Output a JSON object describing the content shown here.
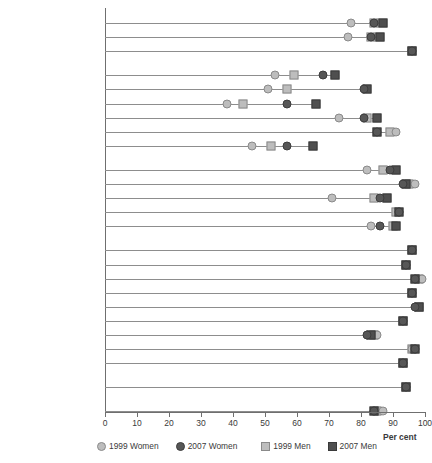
{
  "chart_data": {
    "type": "scatter",
    "title": "",
    "xlabel": "Per cent",
    "ylabel": "",
    "xlim": [
      0,
      100
    ],
    "xticks": [
      0,
      10,
      20,
      30,
      40,
      50,
      60,
      70,
      80,
      90,
      100
    ],
    "grid": false,
    "legend_position": "bottom",
    "series": [
      {
        "name": "1999 Women",
        "marker": "circle",
        "color": "#bdbdbd"
      },
      {
        "name": "2007 Women",
        "marker": "circle",
        "color": "#575757"
      },
      {
        "name": "1999 Men",
        "marker": "square",
        "color": "#bdbdbd"
      },
      {
        "name": "2007 Men",
        "marker": "square",
        "color": "#4f4f4f"
      }
    ],
    "categories": [
      {
        "label": "World",
        "bold": true,
        "spacer_before": false,
        "values": {
          "1999 Women": 77,
          "2007 Women": 84,
          "1999 Men": 84,
          "2007 Men": 87
        }
      },
      {
        "label": "Less developed regions",
        "bold": false,
        "spacer_before": false,
        "values": {
          "1999 Women": 76,
          "2007 Women": 83,
          "1999 Men": 83,
          "2007 Men": 86
        }
      },
      {
        "label": "More developed regions",
        "bold": false,
        "spacer_before": false,
        "values": {
          "1999 Women": 96,
          "2007 Women": 96,
          "1999 Men": 96,
          "2007 Men": 96
        }
      },
      {
        "label": "Africa",
        "bold": true,
        "spacer_before": true,
        "values": {
          "1999 Women": 53,
          "2007 Women": 68,
          "1999 Men": 59,
          "2007 Men": 72
        }
      },
      {
        "label": "Eastern Africa",
        "bold": false,
        "spacer_before": false,
        "values": {
          "1999 Women": 51,
          "2007 Women": 81,
          "1999 Men": 57,
          "2007 Men": 82
        }
      },
      {
        "label": "Middle Africa",
        "bold": false,
        "spacer_before": false,
        "values": {
          "1999 Women": 38,
          "2007 Women": 57,
          "1999 Men": 43,
          "2007 Men": 66
        }
      },
      {
        "label": "Northern Africa",
        "bold": false,
        "spacer_before": false,
        "values": {
          "1999 Women": 73,
          "2007 Women": 81,
          "1999 Men": 82,
          "2007 Men": 85
        }
      },
      {
        "label": "Southern Africa",
        "bold": false,
        "spacer_before": false,
        "values": {
          "1999 Women": 91,
          "2007 Women": 85,
          "1999 Men": 89,
          "2007 Men": 85
        }
      },
      {
        "label": "Western Africa",
        "bold": false,
        "spacer_before": false,
        "values": {
          "1999 Women": 46,
          "2007 Women": 57,
          "1999 Men": 52,
          "2007 Men": 65
        }
      },
      {
        "label": "Asia",
        "bold": true,
        "spacer_before": true,
        "values": {
          "1999 Women": 82,
          "2007 Women": 89,
          "1999 Men": 87,
          "2007 Men": 91
        }
      },
      {
        "label": "Eastern Asia",
        "bold": false,
        "spacer_before": false,
        "values": {
          "1999 Women": 97,
          "2007 Women": 93,
          "1999 Men": 95,
          "2007 Men": 94
        }
      },
      {
        "label": "South-Central Asia",
        "bold": false,
        "spacer_before": false,
        "values": {
          "1999 Women": 71,
          "2007 Women": 86,
          "1999 Men": 84,
          "2007 Men": 88
        }
      },
      {
        "label": "South-Eastern Asia",
        "bold": false,
        "spacer_before": false,
        "values": {
          "1999 Women": 92,
          "2007 Women": 92,
          "1999 Men": 91,
          "2007 Men": 92
        }
      },
      {
        "label": "Western Asia",
        "bold": false,
        "spacer_before": false,
        "values": {
          "1999 Women": 83,
          "2007 Women": 86,
          "1999 Men": 90,
          "2007 Men": 91
        }
      },
      {
        "label": "Europe",
        "bold": true,
        "spacer_before": true,
        "values": {
          "1999 Women": 96,
          "2007 Women": 96,
          "1999 Men": 96,
          "2007 Men": 96
        }
      },
      {
        "label": "Eastern Europe",
        "bold": false,
        "spacer_before": false,
        "values": {
          "1999 Women": 94,
          "2007 Women": 94,
          "1999 Men": 94,
          "2007 Men": 94
        }
      },
      {
        "label": "Northern Europe",
        "bold": false,
        "spacer_before": false,
        "values": {
          "1999 Women": 99,
          "2007 Women": 97,
          "1999 Men": 98,
          "2007 Men": 97
        }
      },
      {
        "label": "Southern Europe",
        "bold": false,
        "spacer_before": false,
        "values": {
          "1999 Women": 96,
          "2007 Women": 96,
          "1999 Men": 96,
          "2007 Men": 96
        }
      },
      {
        "label": "Western Europe",
        "bold": false,
        "spacer_before": false,
        "values": {
          "1999 Women": 98,
          "2007 Women": 97,
          "1999 Men": 98,
          "2007 Men": 98
        }
      },
      {
        "label": "Latin America and the Caribbean",
        "bold": true,
        "spacer_before": false,
        "two_line": true,
        "values": {
          "1999 Women": 93,
          "2007 Women": 93,
          "1999 Men": 93,
          "2007 Men": 93
        }
      },
      {
        "label": "Caribbean",
        "bold": false,
        "spacer_before": false,
        "values": {
          "1999 Women": 85,
          "2007 Women": 82,
          "1999 Men": 84,
          "2007 Men": 83
        }
      },
      {
        "label": "Central America",
        "bold": false,
        "spacer_before": false,
        "values": {
          "1999 Women": 96,
          "2007 Women": 97,
          "1999 Men": 96,
          "2007 Men": 97
        }
      },
      {
        "label": "South America",
        "bold": false,
        "spacer_before": false,
        "values": {
          "1999 Women": 93,
          "2007 Women": 93,
          "1999 Men": 93,
          "2007 Men": 93
        }
      },
      {
        "label": "Northern America",
        "bold": true,
        "spacer_before": true,
        "values": {
          "1999 Women": 94,
          "2007 Women": 94,
          "1999 Men": 94,
          "2007 Men": 94
        }
      },
      {
        "label": "Oceania",
        "bold": true,
        "spacer_before": true,
        "values": {
          "1999 Women": 87,
          "2007 Women": 84,
          "1999 Men": 85,
          "2007 Men": 84
        }
      }
    ]
  },
  "axis": {
    "tick_labels": [
      "0",
      "10",
      "20",
      "30",
      "40",
      "50",
      "60",
      "70",
      "80",
      "90",
      "100"
    ],
    "title": "Per cent"
  },
  "legend": {
    "items": [
      {
        "label": "1999 Women",
        "shape": "circle",
        "tone": "light"
      },
      {
        "label": "2007 Women",
        "shape": "circle",
        "tone": "dark"
      },
      {
        "label": "1999 Men",
        "shape": "square",
        "tone": "light"
      },
      {
        "label": "2007 Men",
        "shape": "square",
        "tone": "dark"
      }
    ]
  }
}
